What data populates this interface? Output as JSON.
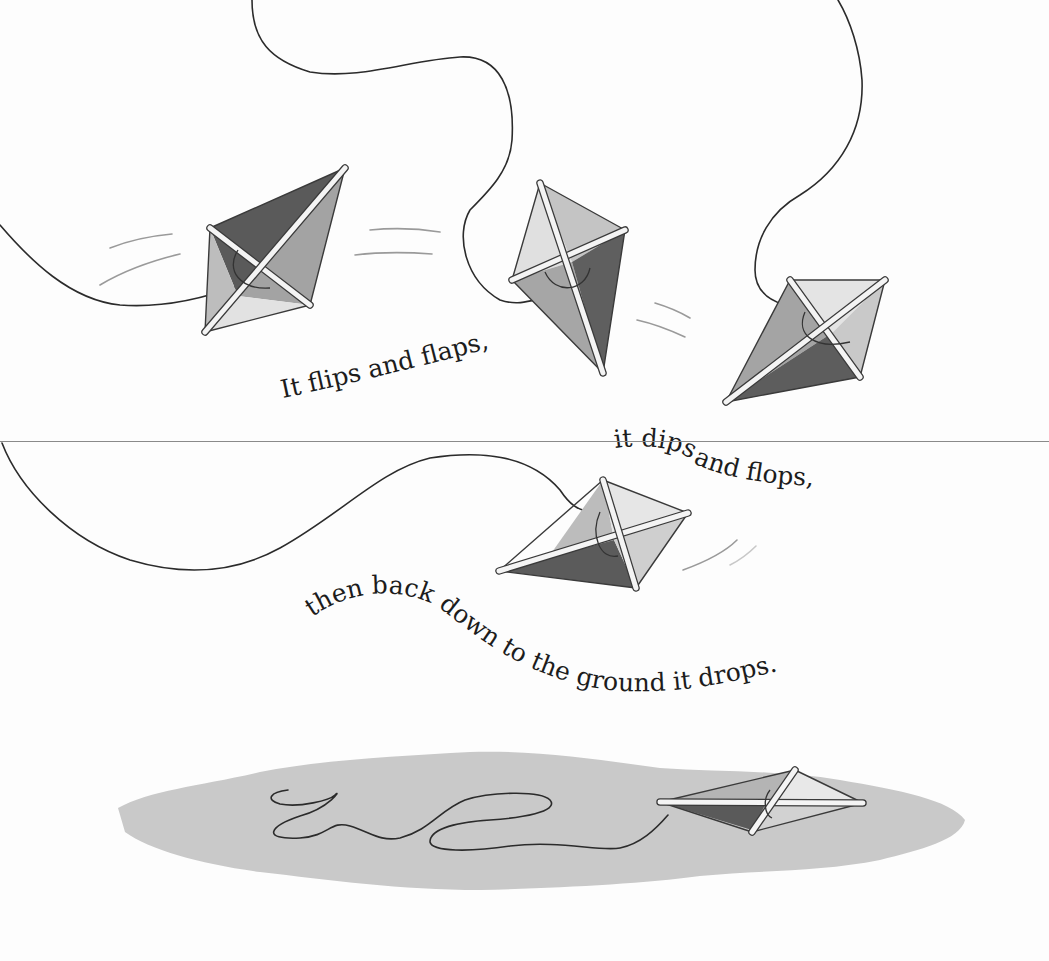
{
  "page": {
    "background": "#fdfdfd",
    "fold_line_color": "#8a8a8a"
  },
  "verse": {
    "line1": "It flips and flaps,",
    "line2_part1": "it dips",
    "line2_part2": "and flops,",
    "line3": "then back down to the ground it drops."
  },
  "illustration": {
    "subject": "kite-tumbling-to-ground",
    "kites": [
      {
        "id": "kite-1",
        "position": "upper-left",
        "state": "flipping"
      },
      {
        "id": "kite-2",
        "position": "upper-center",
        "state": "flapping"
      },
      {
        "id": "kite-3",
        "position": "upper-right",
        "state": "dipping"
      },
      {
        "id": "kite-4",
        "position": "middle-center",
        "state": "flopping"
      },
      {
        "id": "kite-5",
        "position": "ground-right",
        "state": "landed"
      }
    ],
    "colors": {
      "dark_panel": "#5a5a5a",
      "mid_panel": "#9c9c9c",
      "light_panel": "#d9d9d9",
      "ground_shadow": "#c9c9c9",
      "string": "#2b2b2b"
    }
  }
}
